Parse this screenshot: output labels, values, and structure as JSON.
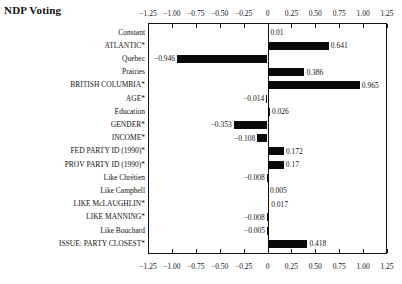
{
  "chart_data": {
    "type": "bar",
    "orientation": "horizontal",
    "title": "NDP Voting",
    "xlabel": "",
    "ylabel": "",
    "xlim": [
      -1.25,
      1.25
    ],
    "grid": false,
    "legend": "none",
    "axis_positions": [
      "top",
      "bottom"
    ],
    "tick_labels": [
      "-1.25",
      "-1.00",
      "-0.75",
      "-0.50",
      "-0.25",
      "0",
      "0.25",
      "0.50",
      "0.75",
      "1.00",
      "1.25"
    ],
    "ticks": [
      -1.25,
      -1.0,
      -0.75,
      -0.5,
      -0.25,
      0,
      0.25,
      0.5,
      0.75,
      1.0,
      1.25
    ],
    "categories": [
      "Constant",
      "ATLANTIC*",
      "Quebec",
      "Prairies",
      "BRITISH COLUMBIA*",
      "AGE*",
      "Education",
      "GENDER*",
      "INCOME*",
      "FED PARTY ID (1990)*",
      "PROV PARTY ID (1990)*",
      "Like Chrétien",
      "Like Campbell",
      "LIKE McLAUGHLIN*",
      "LIKE MANNING*",
      "Like Bouchard",
      "ISSUE: PARTY CLOSEST*"
    ],
    "values": [
      0.01,
      0.641,
      -0.946,
      0.386,
      0.965,
      -0.014,
      0.026,
      -0.353,
      -0.108,
      0.172,
      0.17,
      -0.008,
      0.005,
      0.017,
      -0.008,
      -0.005,
      0.418
    ],
    "value_labels": [
      "0.01",
      "0.641",
      "-0.946",
      "0.386",
      "0.965",
      "-0.014",
      "0.026",
      "-0.353",
      "-0.108",
      "0.172",
      "0.17",
      "-0.008",
      "0.005",
      "0.017",
      "-0.008",
      "-0.005",
      "0.418"
    ],
    "bar_color": "#0a0a0a"
  }
}
